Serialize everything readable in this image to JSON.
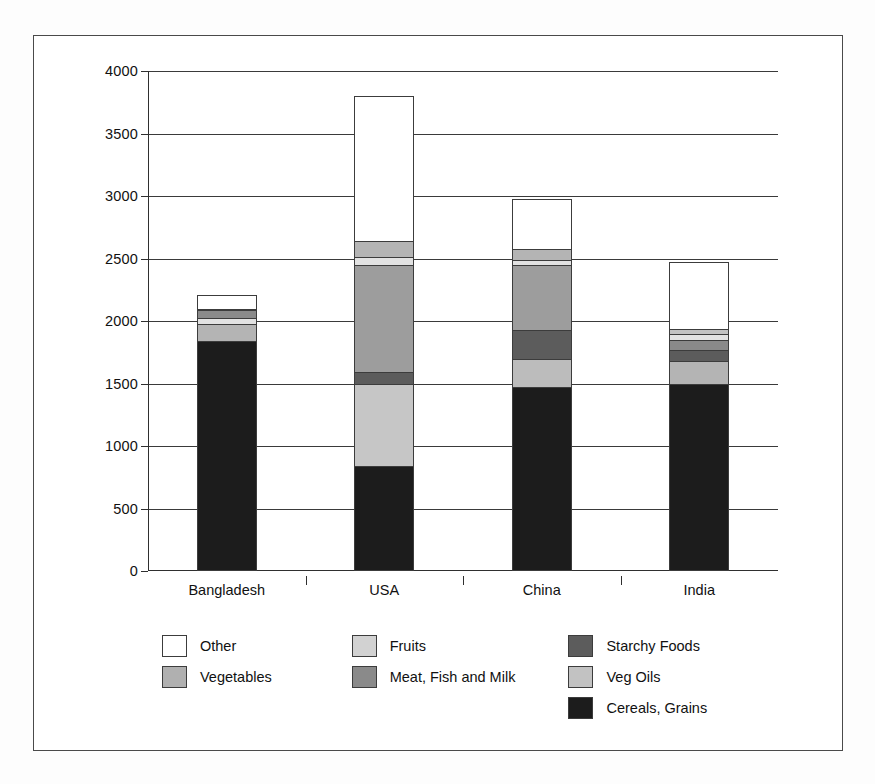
{
  "chart_data": {
    "type": "bar",
    "subtype": "stacked-vertical",
    "title": "",
    "xlabel": "",
    "ylabel": "",
    "ylim": [
      0,
      4000
    ],
    "yticks": [
      0,
      500,
      1000,
      1500,
      2000,
      2500,
      3000,
      3500,
      4000
    ],
    "ytick_labels": [
      "0",
      "500",
      "1000",
      "1500",
      "2000",
      "2500",
      "3000",
      "3500",
      "4000"
    ],
    "grid": "horizontal",
    "legend_position": "below",
    "categories": [
      "Bangladesh",
      "USA",
      "China",
      "India"
    ],
    "series": [
      {
        "name": "Cereals, Grains",
        "color": "#1c1c1c",
        "values": [
          1840,
          840,
          1470,
          1500
        ]
      },
      {
        "name": "Veg Oils",
        "color": "#c2c2c2",
        "values": [
          140,
          0,
          0,
          180
        ]
      },
      {
        "name": "Fruits",
        "color": "#d5d5d5",
        "values": [
          0,
          660,
          230,
          0
        ]
      },
      {
        "name": "Starchy Foods",
        "color": "#5c5c5c",
        "values": [
          0,
          0,
          0,
          90
        ]
      },
      {
        "name": "Meat, Fish and Milk",
        "color": "#8a8a8a",
        "values": [
          60,
          90,
          230,
          110
        ]
      },
      {
        "name": "Veg Oils (upper)",
        "color": "#a0a0a0",
        "values": [
          0,
          860,
          520,
          0
        ]
      },
      {
        "name": "Vegetables",
        "color": "#ababab",
        "values": [
          45,
          130,
          130,
          60
        ]
      },
      {
        "name": "Other",
        "color": "#ffffff",
        "values": [
          120,
          1220,
          400,
          530
        ]
      }
    ],
    "totals": [
      2205,
      3800,
      2980,
      2470
    ],
    "stack_order_bottom_to_top": [
      "Cereals, Grains",
      "Fruits",
      "Meat, Fish and Milk",
      "Veg Oils",
      "Vegetables",
      "Other"
    ],
    "bars": [
      {
        "category": "Bangladesh",
        "total": 2205,
        "segments": [
          {
            "name": "Cereals, Grains",
            "value": 1840,
            "color": "#1c1c1c"
          },
          {
            "name": "Veg Oils",
            "value": 140,
            "color": "#b4b4b4"
          },
          {
            "name": "Fruits",
            "value": 45,
            "color": "#e2e2e2"
          },
          {
            "name": "Meat, Fish and Milk",
            "value": 60,
            "color": "#8a8a8a"
          },
          {
            "name": "Vegetables",
            "value": 10,
            "color": "#c8c8c8"
          },
          {
            "name": "Other",
            "value": 110,
            "color": "#ffffff"
          }
        ]
      },
      {
        "category": "USA",
        "total": 3800,
        "segments": [
          {
            "name": "Cereals, Grains",
            "value": 840,
            "color": "#1c1c1c"
          },
          {
            "name": "Fruits",
            "value": 660,
            "color": "#c6c6c6"
          },
          {
            "name": "Meat, Fish and Milk",
            "value": 90,
            "color": "#5c5c5c"
          },
          {
            "name": "Veg Oils",
            "value": 860,
            "color": "#9d9d9d"
          },
          {
            "name": "Fruits (upper)",
            "value": 60,
            "color": "#e2e2e2"
          },
          {
            "name": "Vegetables",
            "value": 130,
            "color": "#b4b4b4"
          },
          {
            "name": "Other",
            "value": 1160,
            "color": "#ffffff"
          }
        ]
      },
      {
        "category": "China",
        "total": 2980,
        "segments": [
          {
            "name": "Cereals, Grains",
            "value": 1470,
            "color": "#1c1c1c"
          },
          {
            "name": "Fruits",
            "value": 230,
            "color": "#bcbcbc"
          },
          {
            "name": "Meat, Fish and Milk",
            "value": 230,
            "color": "#5c5c5c"
          },
          {
            "name": "Veg Oils",
            "value": 520,
            "color": "#9d9d9d"
          },
          {
            "name": "Fruits (upper)",
            "value": 40,
            "color": "#e2e2e2"
          },
          {
            "name": "Vegetables",
            "value": 90,
            "color": "#b4b4b4"
          },
          {
            "name": "Other",
            "value": 400,
            "color": "#ffffff"
          }
        ]
      },
      {
        "category": "India",
        "total": 2470,
        "segments": [
          {
            "name": "Cereals, Grains",
            "value": 1500,
            "color": "#1c1c1c"
          },
          {
            "name": "Veg Oils",
            "value": 180,
            "color": "#b4b4b4"
          },
          {
            "name": "Starchy Foods",
            "value": 90,
            "color": "#5c5c5c"
          },
          {
            "name": "Meat, Fish and Milk",
            "value": 80,
            "color": "#8a8a8a"
          },
          {
            "name": "Fruits",
            "value": 50,
            "color": "#e2e2e2"
          },
          {
            "name": "Vegetables",
            "value": 40,
            "color": "#c2c2c2"
          },
          {
            "name": "Other",
            "value": 530,
            "color": "#ffffff"
          }
        ]
      }
    ]
  },
  "legend": {
    "columns": [
      [
        {
          "label": "Other",
          "color": "#ffffff"
        },
        {
          "label": "Vegetables",
          "color": "#b0b0b0"
        }
      ],
      [
        {
          "label": "Fruits",
          "color": "#d2d2d2"
        },
        {
          "label": "Meat, Fish and Milk",
          "color": "#8a8a8a"
        }
      ],
      [
        {
          "label": "Starchy Foods",
          "color": "#5c5c5c"
        },
        {
          "label": "Veg Oils",
          "color": "#c2c2c2"
        },
        {
          "label": "Cereals, Grains",
          "color": "#1c1c1c"
        }
      ]
    ]
  }
}
